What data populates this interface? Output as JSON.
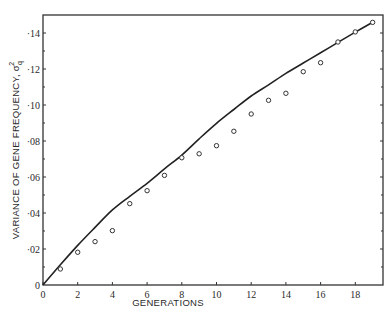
{
  "chart_data": {
    "type": "line",
    "title": "",
    "xlabel": "GENERATIONS",
    "ylabel": "VARIANCE OF GENE FREQUENCY, σ²q",
    "ylabel_main": "VARIANCE OF GENE FREQUENCY, σ",
    "ylabel_sup": "2",
    "ylabel_sub": "q",
    "xlim": [
      0,
      19.6
    ],
    "ylim": [
      0,
      0.15
    ],
    "grid": false,
    "legend": null,
    "x_ticks": [
      0,
      2,
      4,
      6,
      8,
      10,
      12,
      14,
      16,
      18
    ],
    "x_tick_labels": [
      "0",
      "2",
      "4",
      "6",
      "8",
      "10",
      "12",
      "14",
      "16",
      "18"
    ],
    "y_ticks": [
      0,
      0.02,
      0.04,
      0.06,
      0.08,
      0.1,
      0.12,
      0.14
    ],
    "y_tick_labels": [
      "0",
      "·02",
      "·04",
      "·06",
      "·08",
      "·10",
      "·12",
      "·14"
    ],
    "series": [
      {
        "name": "Theoretical variance (curve)",
        "style": "line",
        "x": [
          0,
          1,
          2,
          3,
          4,
          5,
          6,
          7,
          8,
          9,
          10,
          11,
          12,
          13,
          14,
          15,
          16,
          17,
          18,
          19
        ],
        "values": [
          0,
          0.0112,
          0.022,
          0.032,
          0.0417,
          0.0493,
          0.0565,
          0.0645,
          0.0722,
          0.0812,
          0.0898,
          0.0975,
          0.105,
          0.1112,
          0.1176,
          0.1233,
          0.129,
          0.1348,
          0.1405,
          0.146
        ]
      },
      {
        "name": "Observed variance (points)",
        "style": "open-circle",
        "x": [
          1,
          2,
          3,
          4,
          5,
          6,
          7,
          8,
          9,
          10,
          11,
          12,
          13,
          14,
          15,
          16,
          17,
          18,
          19
        ],
        "values": [
          0.0089,
          0.0182,
          0.0241,
          0.0302,
          0.0452,
          0.0524,
          0.0609,
          0.0707,
          0.0729,
          0.0774,
          0.0854,
          0.095,
          0.1026,
          0.1065,
          0.1185,
          0.1235,
          0.135,
          0.1406,
          0.1459
        ]
      }
    ]
  }
}
